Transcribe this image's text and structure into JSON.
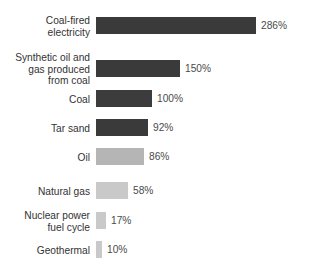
{
  "chart_data": {
    "type": "bar",
    "orientation": "horizontal",
    "title": "",
    "subtitle": "",
    "xlabel": "",
    "ylabel": "",
    "grid": false,
    "legend": "none",
    "value_suffix": "%",
    "xlim": [
      0,
      286
    ],
    "categories": [
      "Coal-fired\nelectricity",
      "Synthetic oil and\ngas produced\nfrom coal",
      "Coal",
      "Tar sand",
      "Oil",
      "Natural gas",
      "Nuclear power\nfuel cycle",
      "Geothermal"
    ],
    "values": [
      286,
      150,
      100,
      92,
      86,
      58,
      17,
      10
    ],
    "value_labels": [
      "286%",
      "150%",
      "100%",
      "92%",
      "86%",
      "58%",
      "17%",
      "10%"
    ],
    "bar_colors": [
      "#3a3a3a",
      "#3a3a3a",
      "#3c3c3c",
      "#3a3a3a",
      "#b5b5b5",
      "#c9c9c9",
      "#c9c9c9",
      "#c9c9c9"
    ]
  },
  "layout": {
    "plot_left_px": 96,
    "px_per_percent": 0.56,
    "bar_height_px": 17,
    "row_tops_px": [
      17,
      60,
      90,
      119,
      148,
      182,
      212,
      241
    ],
    "label_color": "#333333",
    "value_color": "#4a4a4a",
    "background": "#ffffff"
  }
}
